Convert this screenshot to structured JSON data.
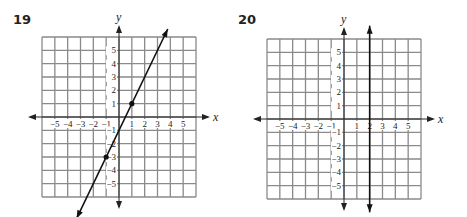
{
  "problems": [
    {
      "number": "19"
    },
    {
      "number": "20"
    }
  ],
  "colors": {
    "grid": "#8a8a8a",
    "axis": "#222222",
    "line": "#111111",
    "background": "#ffffff"
  },
  "chart_data": [
    {
      "type": "line",
      "title": "19",
      "xlabel": "x",
      "ylabel": "y",
      "xlim": [
        -6,
        6
      ],
      "ylim": [
        -6,
        6
      ],
      "grid": true,
      "x_ticks": [
        -5,
        -4,
        -3,
        -2,
        -1,
        1,
        2,
        3,
        4,
        5
      ],
      "y_ticks": [
        -5,
        -4,
        -3,
        -2,
        -1,
        1,
        2,
        3,
        4,
        5
      ],
      "equation": "y = 2x - 1",
      "points": [
        {
          "x": 1,
          "y": 1
        },
        {
          "x": -1,
          "y": -3
        }
      ],
      "line_endpoints": [
        {
          "x": -3.3,
          "y": -7.6
        },
        {
          "x": 3.8,
          "y": 6.6
        }
      ]
    },
    {
      "type": "line",
      "title": "20",
      "xlabel": "x",
      "ylabel": "y",
      "xlim": [
        -6,
        6
      ],
      "ylim": [
        -6,
        6
      ],
      "grid": true,
      "x_ticks": [
        -5,
        -4,
        -3,
        -2,
        -1,
        1,
        2,
        3,
        4,
        5
      ],
      "y_ticks": [
        -5,
        -4,
        -3,
        -2,
        -1,
        1,
        2,
        3,
        4,
        5
      ],
      "equation": "x = 2",
      "points": [],
      "line_endpoints": [
        {
          "x": 2,
          "y": -7
        },
        {
          "x": 2,
          "y": 7
        }
      ]
    }
  ]
}
